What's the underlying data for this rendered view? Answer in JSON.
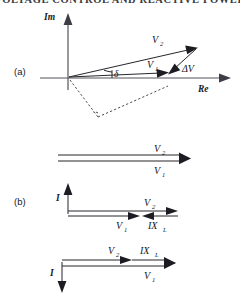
{
  "header": {
    "title": "VOLTAGE CONTROL AND REACTIVE POWER"
  },
  "figure": {
    "panels": [
      {
        "tag": "(a)",
        "type": "phasor-complex-plane",
        "axes": {
          "vertical": "Im",
          "horizontal": "Re"
        },
        "vectors": [
          {
            "name": "V2",
            "label": "V",
            "subscript": "2"
          },
          {
            "name": "V1",
            "label": "V",
            "subscript": "1"
          },
          {
            "name": "dV",
            "label": "ΔV",
            "subscript": ""
          }
        ],
        "angles": [
          {
            "name": "delta",
            "label": "δ"
          }
        ]
      },
      {
        "tag": "",
        "type": "parallel-phasor-pair",
        "vectors": [
          {
            "name": "V2",
            "label": "V",
            "subscript": "2"
          },
          {
            "name": "V1",
            "label": "V",
            "subscript": "1"
          }
        ]
      },
      {
        "tag": "(b)",
        "type": "phasor-with-current-axis",
        "axes": {
          "vertical": "I"
        },
        "vectors": [
          {
            "name": "V2",
            "label": "V",
            "subscript": "2"
          },
          {
            "name": "V1",
            "label": "V",
            "subscript": "1"
          },
          {
            "name": "IXL",
            "label": "IX",
            "subscript": "L"
          }
        ]
      },
      {
        "tag": "",
        "type": "phasor-with-current-axis-inverted",
        "axes": {
          "vertical": "I"
        },
        "vectors": [
          {
            "name": "V2",
            "label": "V",
            "subscript": "2"
          },
          {
            "name": "V1",
            "label": "V",
            "subscript": "1"
          },
          {
            "name": "IXL",
            "label": "IX",
            "subscript": "L"
          }
        ]
      }
    ]
  },
  "colors": {
    "ink": "#1c1c22",
    "axis": "#55555d",
    "dashed": "#4a4a52",
    "background": "#ffffff"
  }
}
